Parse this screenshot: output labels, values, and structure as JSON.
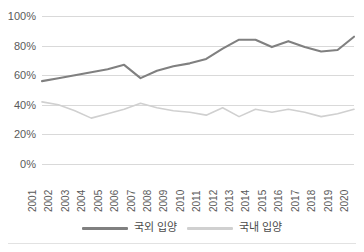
{
  "chart_data": {
    "type": "line",
    "title": "",
    "subtitle": "",
    "xlabel": "",
    "ylabel": "",
    "grid": true,
    "legend_position": "bottom",
    "ylim": [
      0,
      100
    ],
    "y_ticks": [
      "0%",
      "20%",
      "40%",
      "60%",
      "80%",
      "100%"
    ],
    "y_tick_values": [
      0,
      20,
      40,
      60,
      80,
      100
    ],
    "categories": [
      "2001",
      "2002",
      "2003",
      "2004",
      "2005",
      "2006",
      "2007",
      "2008",
      "2009",
      "2010",
      "2011",
      "2012",
      "2013",
      "2014",
      "2015",
      "2016",
      "2017",
      "2018",
      "2019",
      "2020"
    ],
    "x": [
      "2001",
      "2002",
      "2003",
      "2004",
      "2005",
      "2006",
      "2007",
      "2008",
      "2009",
      "2010",
      "2011",
      "2012",
      "2013",
      "2014",
      "2015",
      "2016",
      "2017",
      "2018",
      "2019",
      "2020"
    ],
    "series": [
      {
        "name": "국외 입양",
        "color": "#808080",
        "values": [
          56,
          58,
          60,
          62,
          64,
          67,
          58,
          63,
          66,
          68,
          71,
          78,
          84,
          84,
          79,
          83,
          79,
          76,
          77,
          86
        ]
      },
      {
        "name": "국내 입양",
        "color": "#d0d0d0",
        "values": [
          42,
          40,
          36,
          31,
          34,
          37,
          41,
          38,
          36,
          35,
          33,
          38,
          32,
          37,
          35,
          37,
          35,
          32,
          34,
          37
        ]
      }
    ]
  },
  "legend": {
    "items": [
      {
        "label": "국외 입양",
        "color": "#808080"
      },
      {
        "label": "국내 입양",
        "color": "#d0d0d0"
      }
    ]
  },
  "colors": {
    "overseas_line": "#808080",
    "domestic_line": "#d0d0d0",
    "gridline": "#d9d9d9",
    "tick_text": "#5a5a5a",
    "background": "#ffffff"
  }
}
